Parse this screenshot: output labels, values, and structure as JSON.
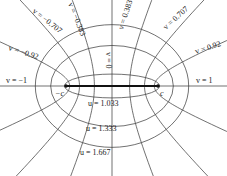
{
  "diagram": {
    "geometry": {
      "cx": 112,
      "cy": 86,
      "c": 46
    },
    "colors": {
      "line": "#333333",
      "segment": "#111111",
      "text": "#222222",
      "background": "#ffffff"
    },
    "foci": [
      {
        "id": "left-focus",
        "label": "−c",
        "x": 55,
        "y": 96
      },
      {
        "id": "right-focus",
        "label": "c",
        "x": 160,
        "y": 96
      }
    ],
    "ellipses": [
      {
        "u": 1.033,
        "label": "u = 1.033",
        "lx": 88,
        "ly": 106
      },
      {
        "u": 1.333,
        "label": "u = 1.333",
        "lx": 86,
        "ly": 131
      },
      {
        "u": 1.667,
        "label": "u = 1.667",
        "lx": 80,
        "ly": 155
      }
    ],
    "hyperbolas": [
      {
        "v": -0.92,
        "label": "v = −0.92",
        "lx": 8,
        "ly": 50,
        "rot": 18
      },
      {
        "v": -0.707,
        "label": "v = −0.707",
        "lx": 32,
        "ly": 12,
        "rot": 38
      },
      {
        "v": -0.383,
        "label": "v = −0.383",
        "lx": 68,
        "ly": 4,
        "rot": 68
      },
      {
        "v": 0.383,
        "label": "v = 0.383",
        "lx": 123,
        "ly": 30,
        "rot": -72
      },
      {
        "v": 0.707,
        "label": "v = 0.707",
        "lx": 166,
        "ly": 30,
        "rot": -42
      },
      {
        "v": 0.92,
        "label": "v = 0.92",
        "lx": 196,
        "ly": 54,
        "rot": -18
      }
    ],
    "axis_labels": [
      {
        "label": "v = −1",
        "x": 6,
        "y": 83,
        "rot": 0
      },
      {
        "label": "v = 1",
        "x": 196,
        "y": 83,
        "rot": 0
      },
      {
        "label": "v = 0",
        "x": 106,
        "y": 52,
        "rot": 90
      }
    ]
  }
}
